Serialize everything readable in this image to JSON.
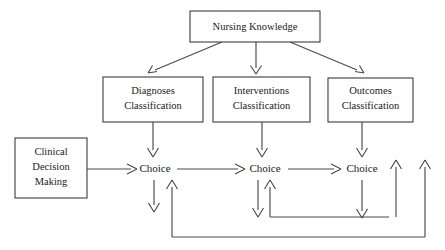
{
  "diagram": {
    "type": "flowchart",
    "canvas": {
      "width": 445,
      "height": 250,
      "background": "#ffffff"
    },
    "colors": {
      "box_stroke": "#3c3c3c",
      "box_fill": "#ffffff",
      "edge": "#4a4a4a",
      "text": "#1a1a1a"
    },
    "boxes": [
      {
        "id": "nursing-knowledge",
        "label": "Nursing Knowledge",
        "lines": [
          "Nursing Knowledge"
        ],
        "x": 190,
        "y": 11,
        "w": 130,
        "h": 31
      },
      {
        "id": "diagnoses-classification",
        "label": "Diagnoses Classification",
        "lines": [
          "Diagnoses",
          "Classification"
        ],
        "x": 103,
        "y": 77,
        "w": 100,
        "h": 45
      },
      {
        "id": "interventions-classification",
        "label": "Interventions Classification",
        "lines": [
          "Interventions",
          "Classification"
        ],
        "x": 213,
        "y": 77,
        "w": 97,
        "h": 45
      },
      {
        "id": "outcomes-classification",
        "label": "Outcomes Classification",
        "lines": [
          "Outcomes",
          "Classification"
        ],
        "x": 328,
        "y": 78,
        "w": 85,
        "h": 44
      },
      {
        "id": "clinical-decision-making",
        "label": "Clinical Decision Making",
        "lines": [
          "Clinical",
          "Decision",
          "Making"
        ],
        "x": 15,
        "y": 138,
        "w": 72,
        "h": 60
      }
    ],
    "nodes": [
      {
        "id": "choice-1",
        "label": "Choice",
        "x": 155,
        "y": 169
      },
      {
        "id": "choice-2",
        "label": "Choice",
        "x": 265,
        "y": 169
      },
      {
        "id": "choice-3",
        "label": "Choice",
        "x": 362,
        "y": 169
      }
    ],
    "edges": [
      {
        "id": "nk-to-diagnoses",
        "from": "nursing-knowledge",
        "to": "diagnoses-classification",
        "style": "diagonal-down-left"
      },
      {
        "id": "nk-to-interventions",
        "from": "nursing-knowledge",
        "to": "interventions-classification",
        "style": "vertical-down"
      },
      {
        "id": "nk-to-outcomes",
        "from": "nursing-knowledge",
        "to": "outcomes-classification",
        "style": "diagonal-down-right"
      },
      {
        "id": "diagnoses-to-choice1",
        "from": "diagnoses-classification",
        "to": "choice-1",
        "style": "vertical-down"
      },
      {
        "id": "interventions-to-choice2",
        "from": "interventions-classification",
        "to": "choice-2",
        "style": "vertical-down"
      },
      {
        "id": "outcomes-to-choice3",
        "from": "outcomes-classification",
        "to": "choice-3",
        "style": "vertical-down"
      },
      {
        "id": "cdm-to-choice1",
        "from": "clinical-decision-making",
        "to": "choice-1",
        "style": "horizontal-right"
      },
      {
        "id": "choice1-to-choice2",
        "from": "choice-1",
        "to": "choice-2",
        "style": "horizontal-right"
      },
      {
        "id": "choice2-to-choice3",
        "from": "choice-2",
        "to": "choice-3",
        "style": "horizontal-right"
      },
      {
        "id": "choice1-down-stub",
        "from": "choice-1",
        "to": "bottom",
        "style": "vertical-down-stub"
      },
      {
        "id": "choice2-down-stub",
        "from": "choice-2",
        "to": "bottom",
        "style": "vertical-down-stub"
      },
      {
        "id": "choice3-feedback-to-choice2",
        "from": "choice-3",
        "to": "choice-2",
        "style": "feedback-loop-inner"
      },
      {
        "id": "far-right-feedback-to-choice3",
        "from": "outer-right",
        "to": "choice-3",
        "style": "feedback-loop-outer-right"
      },
      {
        "id": "bottom-feedback-to-choice1",
        "from": "bottom-rail",
        "to": "choice-1",
        "style": "feedback-loop-bottom"
      }
    ]
  }
}
